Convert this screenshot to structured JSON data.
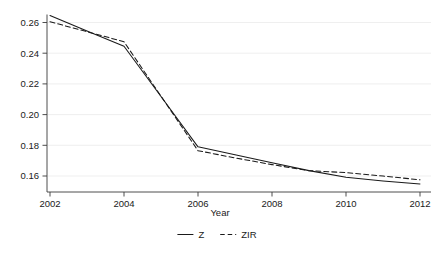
{
  "chart_data": {
    "type": "line",
    "title": "",
    "subtitle": "",
    "xlabel": "Year",
    "ylabel": "",
    "x": [
      2002,
      2003,
      2004,
      2005,
      2006,
      2007,
      2008,
      2009,
      2010,
      2011,
      2012
    ],
    "xlim": [
      2001.6,
      2012.4
    ],
    "ylim": [
      0.1505,
      0.2665
    ],
    "xticks": [
      2002,
      2004,
      2006,
      2008,
      2010,
      2012
    ],
    "xticklabels": [
      "2002",
      "2004",
      "2006",
      "2008",
      "2010",
      "2012"
    ],
    "yticks": [
      0.16,
      0.18,
      0.2,
      0.22,
      0.24,
      0.26
    ],
    "yticklabels": [
      "0.16",
      "0.18",
      "0.20",
      "0.22",
      "0.24",
      "0.26"
    ],
    "grid": "horizontal",
    "legend_position": "bottom-center",
    "series": [
      {
        "name": "Z",
        "style": "solid",
        "color": "#1a1a1a",
        "values": [
          0.2645,
          0.2545,
          0.2445,
          0.2118,
          0.179,
          0.1738,
          0.1686,
          0.1635,
          0.1592,
          0.1568,
          0.1548
        ]
      },
      {
        "name": "ZIR",
        "style": "dashed",
        "color": "#1a1a1a",
        "values": [
          0.2605,
          0.254,
          0.2475,
          0.212,
          0.1765,
          0.1718,
          0.1674,
          0.1635,
          0.1622,
          0.16,
          0.1575
        ]
      }
    ],
    "legend": [
      {
        "label": "Z",
        "style": "solid"
      },
      {
        "label": "ZIR",
        "style": "dashed"
      }
    ]
  },
  "axes": {
    "x_title": "Year"
  },
  "colors": {
    "line": "#1a1a1a",
    "grid": "#e8e8e8",
    "spine": "#3a3a3a",
    "background": "#ffffff"
  }
}
